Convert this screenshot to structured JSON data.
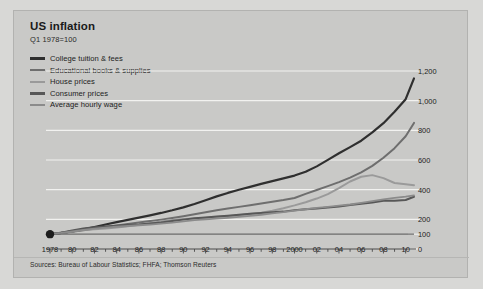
{
  "header": {
    "title": "US inflation",
    "subtitle": "Q1 1978=100"
  },
  "source": {
    "text": "Sources: Bureau of Labour Statistics; FHFA; Thomson Reuters"
  },
  "colors": {
    "background": "#c9c9c7",
    "page_background": "#d8d8d6",
    "gridline": "#f2f2f0",
    "axis": "#4a4a4a",
    "college_tuition": "#2f2f2f",
    "educational_books": "#6e6e6e",
    "house_prices": "#9a9a9a",
    "consumer_prices": "#575757",
    "average_hourly_wage": "#8b8b8b",
    "baseline": "#6b6b6b"
  },
  "chart_data": {
    "type": "line",
    "title": "US inflation",
    "subtitle": "Q1 1978=100",
    "xlabel": "",
    "ylabel": "",
    "xlim": [
      1978,
      2010.75
    ],
    "ylim": [
      0,
      1200
    ],
    "grid": true,
    "legend_position": "top-left",
    "yticks": [
      0,
      100,
      200,
      400,
      600,
      800,
      1000,
      1200
    ],
    "ytick_labels": [
      "0",
      "100",
      "200",
      "400",
      "600",
      "800",
      "1,000",
      "1,200"
    ],
    "xticks": [
      1978,
      1980,
      1982,
      1984,
      1986,
      1988,
      1990,
      1992,
      1994,
      1996,
      1998,
      2000,
      2002,
      2004,
      2006,
      2008,
      2010
    ],
    "xtick_labels": [
      "1978",
      "80",
      "82",
      "84",
      "86",
      "88",
      "90",
      "92",
      "94",
      "96",
      "98",
      "2000",
      "02",
      "04",
      "06",
      "08",
      "10"
    ],
    "minor_xtick_interval": 1,
    "origin_marker": {
      "x": 1978,
      "y": 100,
      "label": ""
    },
    "x": [
      1978,
      1979,
      1980,
      1981,
      1982,
      1983,
      1984,
      1985,
      1986,
      1987,
      1988,
      1989,
      1990,
      1991,
      1992,
      1993,
      1994,
      1995,
      1996,
      1997,
      1998,
      1999,
      2000,
      2001,
      2002,
      2003,
      2004,
      2005,
      2006,
      2007,
      2008,
      2009,
      2010,
      2010.75
    ],
    "series": [
      {
        "name": "College tuition & fees",
        "color": "#2f2f2f",
        "width": 2.2,
        "values": [
          100,
          109,
          119,
          132,
          148,
          165,
          181,
          196,
          212,
          227,
          243,
          261,
          281,
          303,
          329,
          355,
          378,
          399,
          419,
          439,
          458,
          476,
          495,
          521,
          557,
          601,
          645,
          687,
          730,
          786,
          848,
          925,
          1010,
          1150
        ]
      },
      {
        "name": "Educational books & supplies",
        "color": "#6e6e6e",
        "width": 2.0,
        "values": [
          100,
          107,
          116,
          126,
          137,
          148,
          158,
          168,
          178,
          188,
          198,
          209,
          221,
          234,
          248,
          261,
          273,
          284,
          295,
          306,
          318,
          330,
          344,
          372,
          398,
          424,
          451,
          481,
          516,
          560,
          615,
          680,
          760,
          850
        ]
      },
      {
        "name": "House prices",
        "color": "#9a9a9a",
        "width": 2.0,
        "values": [
          100,
          110,
          120,
          129,
          133,
          138,
          145,
          153,
          163,
          174,
          185,
          195,
          202,
          206,
          210,
          215,
          221,
          228,
          236,
          245,
          258,
          275,
          294,
          315,
          340,
          370,
          410,
          455,
          487,
          498,
          478,
          445,
          437,
          430
        ]
      },
      {
        "name": "Consumer prices",
        "color": "#575757",
        "width": 2.0,
        "values": [
          100,
          110,
          125,
          138,
          146,
          151,
          157,
          163,
          166,
          172,
          179,
          188,
          198,
          207,
          213,
          219,
          225,
          231,
          238,
          243,
          247,
          252,
          261,
          268,
          273,
          279,
          286,
          296,
          305,
          314,
          326,
          325,
          330,
          352
        ]
      },
      {
        "name": "Average hourly wage",
        "color": "#8b8b8b",
        "width": 1.8,
        "values": [
          100,
          108,
          118,
          129,
          138,
          144,
          150,
          155,
          160,
          165,
          171,
          178,
          186,
          194,
          200,
          205,
          210,
          216,
          223,
          231,
          240,
          248,
          258,
          268,
          277,
          284,
          292,
          300,
          311,
          323,
          334,
          344,
          353,
          362
        ]
      }
    ],
    "reference_line": {
      "y": 100,
      "color": "#6b6b6b",
      "width": 1.1
    }
  },
  "legend": {
    "items": [
      {
        "label": "College tuition & fees",
        "color": "#2f2f2f",
        "thickness": "3px"
      },
      {
        "label": "Educational books & supplies",
        "color": "#6e6e6e",
        "thickness": "2.4px"
      },
      {
        "label": "House prices",
        "color": "#9a9a9a",
        "thickness": "2.2px"
      },
      {
        "label": "Consumer prices",
        "color": "#575757",
        "thickness": "2.6px"
      },
      {
        "label": "Average hourly wage",
        "color": "#8b8b8b",
        "thickness": "1.8px"
      }
    ]
  }
}
